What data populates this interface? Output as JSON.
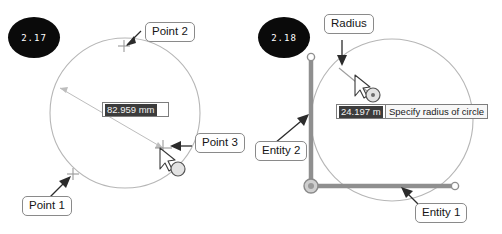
{
  "figure": {
    "title_visible": false,
    "panels": [
      {
        "id": "2.17",
        "badge_label": "2.17",
        "description": "Circle by three points",
        "callouts": [
          {
            "name": "point-2",
            "label": "Point 2"
          },
          {
            "name": "point-3",
            "label": "Point 3"
          },
          {
            "name": "point-1",
            "label": "Point 1"
          }
        ],
        "measurement": {
          "value": "82.959",
          "unit": "mm",
          "full_text": "82.959 mm"
        },
        "cursor_icon": "circle-tool-cursor"
      },
      {
        "id": "2.18",
        "badge_label": "2.18",
        "description": "Circle tangent to two entities with radius",
        "callouts": [
          {
            "name": "radius",
            "label": "Radius"
          },
          {
            "name": "entity-2",
            "label": "Entity 2"
          },
          {
            "name": "entity-1",
            "label": "Entity 1"
          }
        ],
        "measurement": {
          "value": "24.197",
          "unit": "m",
          "full_text": "24.197 m"
        },
        "tooltip": "Specify radius of circle",
        "cursor_icon": "circle-tool-cursor"
      }
    ]
  },
  "colors": {
    "badge_bg": "#0a0a0a",
    "badge_text": "#ffffff",
    "callout_border": "#8a8a8a",
    "geometry_stroke": "#b0b0b0",
    "entity_stroke": "#8f8f8f",
    "value_field_bg": "#3c3c3c",
    "value_field_text": "#f2f2f2",
    "tooltip_bg": "#f7f7f7",
    "leader_stroke": "#2b2b2b"
  }
}
